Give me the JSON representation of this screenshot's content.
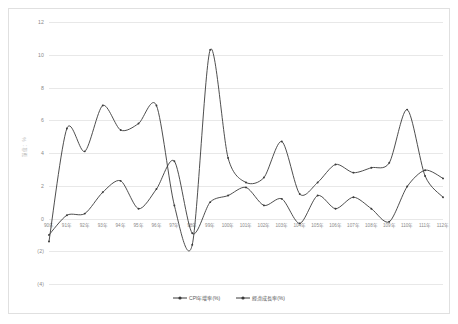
{
  "chart_data": {
    "type": "line",
    "title": "",
    "xlabel": "",
    "ylabel": "單位：%",
    "ylim": [
      -4,
      12
    ],
    "grid": true,
    "legend_position": "bottom",
    "categories": [
      "90年",
      "91年",
      "92年",
      "93年",
      "94年",
      "95年",
      "96年",
      "97年",
      "98年",
      "99年",
      "100年",
      "101年",
      "102年",
      "103年",
      "104年",
      "105年",
      "106年",
      "107年",
      "108年",
      "109年",
      "110年",
      "111年",
      "112年"
    ],
    "ytick_labels": [
      "12",
      "10",
      "8",
      "6",
      "4",
      "2",
      "0",
      "(2)",
      "(4)"
    ],
    "ytick_values": [
      12,
      10,
      8,
      6,
      4,
      2,
      0,
      -2,
      -4
    ],
    "series": [
      {
        "name": "CPI年增率(%)",
        "color": "#3a3a3a",
        "values": [
          -1.0,
          0.2,
          0.3,
          1.6,
          2.3,
          0.6,
          1.8,
          3.5,
          -0.9,
          1.0,
          1.4,
          1.9,
          0.8,
          1.2,
          -0.3,
          1.4,
          0.6,
          1.3,
          0.6,
          -0.2,
          1.95,
          2.95,
          2.45
        ]
      },
      {
        "name": "經濟成長率(%)",
        "color": "#3a3a3a",
        "values": [
          -1.4,
          5.5,
          4.1,
          6.9,
          5.4,
          5.8,
          6.9,
          0.8,
          -1.6,
          10.3,
          3.7,
          2.2,
          2.5,
          4.7,
          1.5,
          2.2,
          3.3,
          2.8,
          3.1,
          3.4,
          6.65,
          2.6,
          1.3
        ]
      }
    ]
  },
  "legend": {
    "items": [
      {
        "label": "CPI年增率(%)"
      },
      {
        "label": "經濟成長率(%)"
      }
    ]
  }
}
